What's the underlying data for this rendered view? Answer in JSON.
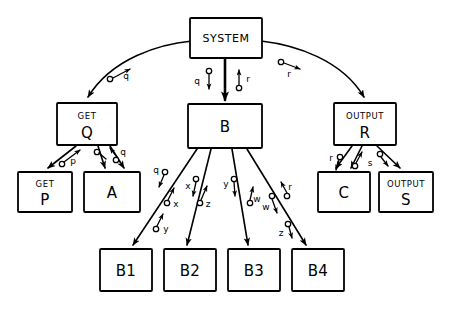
{
  "diagram": {
    "type": "structure-chart",
    "stroke_color": "#000000",
    "background_color": "#ffffff",
    "nodes": [
      {
        "id": "system",
        "label_top": "",
        "label_main": "SYSTEM",
        "style": "medium",
        "x": 190,
        "y": 18,
        "w": 72,
        "h": 40
      },
      {
        "id": "getq",
        "label_top": "GET",
        "label_main": "Q",
        "style": "stacked",
        "x": 57,
        "y": 103,
        "w": 60,
        "h": 42
      },
      {
        "id": "b",
        "label_top": "",
        "label_main": "B",
        "style": "big",
        "x": 188,
        "y": 104,
        "w": 74,
        "h": 44
      },
      {
        "id": "outputr",
        "label_top": "OUTPUT",
        "label_main": "R",
        "style": "stacked",
        "x": 334,
        "y": 103,
        "w": 62,
        "h": 42
      },
      {
        "id": "getp",
        "label_top": "GET",
        "label_main": "P",
        "style": "stacked",
        "x": 18,
        "y": 172,
        "w": 54,
        "h": 40
      },
      {
        "id": "a",
        "label_top": "",
        "label_main": "A",
        "style": "big",
        "x": 84,
        "y": 172,
        "w": 56,
        "h": 40
      },
      {
        "id": "c",
        "label_top": "",
        "label_main": "C",
        "style": "big",
        "x": 318,
        "y": 172,
        "w": 52,
        "h": 40
      },
      {
        "id": "outputs",
        "label_top": "OUTPUT",
        "label_main": "S",
        "style": "stacked",
        "x": 379,
        "y": 172,
        "w": 54,
        "h": 40
      },
      {
        "id": "b1",
        "label_top": "",
        "label_main": "B1",
        "style": "big",
        "x": 100,
        "y": 249,
        "w": 52,
        "h": 42
      },
      {
        "id": "b2",
        "label_top": "",
        "label_main": "B2",
        "style": "big",
        "x": 164,
        "y": 249,
        "w": 52,
        "h": 42
      },
      {
        "id": "b3",
        "label_top": "",
        "label_main": "B3",
        "style": "big",
        "x": 228,
        "y": 249,
        "w": 52,
        "h": 42
      },
      {
        "id": "b4",
        "label_top": "",
        "label_main": "B4",
        "style": "big",
        "x": 292,
        "y": 249,
        "w": 52,
        "h": 42
      }
    ],
    "data_flow_labels": [
      {
        "id": "flow-q-system-left",
        "text": "q",
        "x": 126,
        "y": 76
      },
      {
        "id": "flow-q-b-down",
        "text": "q",
        "x": 196,
        "y": 81
      },
      {
        "id": "flow-r-b-up",
        "text": "r",
        "x": 247,
        "y": 79
      },
      {
        "id": "flow-r-system-right",
        "text": "r",
        "x": 291,
        "y": 73
      },
      {
        "id": "flow-p-getp",
        "text": "p",
        "x": 74,
        "y": 160
      },
      {
        "id": "flow-q-a",
        "text": "q",
        "x": 122,
        "y": 156
      },
      {
        "id": "flow-q-b1",
        "text": "q",
        "x": 157,
        "y": 172
      },
      {
        "id": "flow-x-b1",
        "text": "x",
        "x": 175,
        "y": 203
      },
      {
        "id": "flow-y-b1",
        "text": "y",
        "x": 166,
        "y": 228
      },
      {
        "id": "flow-x-b2",
        "text": "x",
        "x": 189,
        "y": 186
      },
      {
        "id": "flow-z-b2",
        "text": "z",
        "x": 207,
        "y": 203
      },
      {
        "id": "flow-y-b3",
        "text": "y",
        "x": 226,
        "y": 183
      },
      {
        "id": "flow-w-b3",
        "text": "w",
        "x": 254,
        "y": 198
      },
      {
        "id": "flow-w-b4",
        "text": "w",
        "x": 267,
        "y": 208
      },
      {
        "id": "flow-r-b4",
        "text": "r",
        "x": 288,
        "y": 186
      },
      {
        "id": "flow-z-b4",
        "text": "z",
        "x": 281,
        "y": 232
      },
      {
        "id": "flow-r-c",
        "text": "r",
        "x": 331,
        "y": 159
      },
      {
        "id": "flow-s-outputs",
        "text": "s",
        "x": 371,
        "y": 163
      }
    ],
    "connections": [
      {
        "from": "system",
        "to": "getq",
        "kind": "curve"
      },
      {
        "from": "system",
        "to": "b",
        "kind": "straight-thick"
      },
      {
        "from": "system",
        "to": "outputr",
        "kind": "curve"
      },
      {
        "from": "getq",
        "to": "getp",
        "kind": "straight"
      },
      {
        "from": "getq",
        "to": "a",
        "kind": "straight"
      },
      {
        "from": "b",
        "to": "b1",
        "kind": "straight"
      },
      {
        "from": "b",
        "to": "b2",
        "kind": "straight"
      },
      {
        "from": "b",
        "to": "b3",
        "kind": "straight"
      },
      {
        "from": "b",
        "to": "b4",
        "kind": "straight"
      },
      {
        "from": "outputr",
        "to": "c",
        "kind": "straight"
      },
      {
        "from": "outputr",
        "to": "outputs",
        "kind": "straight"
      }
    ]
  }
}
